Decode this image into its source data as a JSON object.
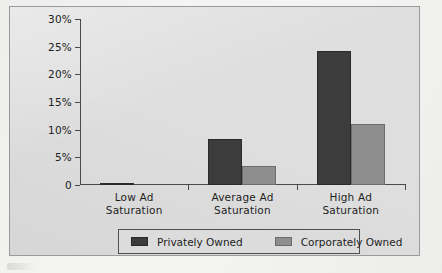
{
  "chart_data": {
    "type": "bar",
    "title": "",
    "subtitle": "",
    "xlabel": "",
    "ylabel": "",
    "categories": [
      "Low Ad\nSaturation",
      "Average Ad\nSaturation",
      "High Ad\nSaturation"
    ],
    "category_lines": [
      [
        "Low Ad",
        "Saturation"
      ],
      [
        "Average Ad",
        "Saturation"
      ],
      [
        "High Ad",
        "Saturation"
      ]
    ],
    "series": [
      {
        "name": "Privately Owned",
        "color": "#3c3c3c",
        "values": [
          0.3,
          8.3,
          24.2
        ]
      },
      {
        "name": "Corporately Owned",
        "color": "#8e8e8e",
        "values": [
          0,
          3.4,
          11.0
        ]
      }
    ],
    "ylim": [
      0,
      30
    ],
    "ytick_values": [
      0,
      5,
      10,
      15,
      20,
      25,
      30
    ],
    "ytick_labels": [
      "0",
      "5%",
      "10%",
      "15%",
      "20%",
      "25%",
      "30%"
    ],
    "grid": false,
    "legend_position": "bottom",
    "value_unit": "%"
  },
  "colors": {
    "page_background": "#f4f4f2",
    "plot_background": "#dedede",
    "frame_border": "#9a9a9a",
    "axis": "#4a4a4a",
    "text": "#1e1e1e",
    "series_privately_owned": "#3c3c3c",
    "series_corporately_owned": "#8e8e8e"
  }
}
